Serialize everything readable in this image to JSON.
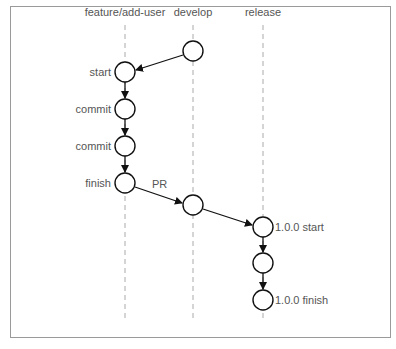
{
  "lanes": [
    {
      "id": "feature",
      "label": "feature/add-user",
      "x": 125
    },
    {
      "id": "develop",
      "label": "develop",
      "x": 193
    },
    {
      "id": "release",
      "label": "release",
      "x": 263
    }
  ],
  "nodes": [
    {
      "id": "d1",
      "lane": "develop",
      "y": 51,
      "label": ""
    },
    {
      "id": "f1",
      "lane": "feature",
      "y": 72,
      "label": "start",
      "label_side": "left"
    },
    {
      "id": "f2",
      "lane": "feature",
      "y": 109,
      "label": "commit",
      "label_side": "left"
    },
    {
      "id": "f3",
      "lane": "feature",
      "y": 146,
      "label": "commit",
      "label_side": "left"
    },
    {
      "id": "f4",
      "lane": "feature",
      "y": 183,
      "label": "finish",
      "label_side": "left"
    },
    {
      "id": "d2",
      "lane": "develop",
      "y": 205,
      "label": ""
    },
    {
      "id": "r1",
      "lane": "release",
      "y": 227,
      "label": "1.0.0 start",
      "label_side": "right"
    },
    {
      "id": "r2",
      "lane": "release",
      "y": 263,
      "label": ""
    },
    {
      "id": "r3",
      "lane": "release",
      "y": 300,
      "label": "1.0.0 finish",
      "label_side": "right"
    }
  ],
  "edges": [
    {
      "from": "d1",
      "to": "f1",
      "label": ""
    },
    {
      "from": "f1",
      "to": "f2",
      "label": ""
    },
    {
      "from": "f2",
      "to": "f3",
      "label": ""
    },
    {
      "from": "f3",
      "to": "f4",
      "label": ""
    },
    {
      "from": "f4",
      "to": "d2",
      "label": "PR"
    },
    {
      "from": "d2",
      "to": "r1",
      "label": ""
    },
    {
      "from": "r1",
      "to": "r2",
      "label": ""
    },
    {
      "from": "r2",
      "to": "r3",
      "label": ""
    }
  ],
  "labels": {
    "lane_feature": "feature/add-user",
    "lane_develop": "develop",
    "lane_release": "release",
    "start": "start",
    "commit1": "commit",
    "commit2": "commit",
    "finish": "finish",
    "pr": "PR",
    "release_start": "1.0.0 start",
    "release_finish": "1.0.0 finish"
  },
  "colors": {
    "line": "#111111",
    "dash": "#aaaaaa",
    "text": "#555555",
    "border": "#9a9a9a"
  }
}
